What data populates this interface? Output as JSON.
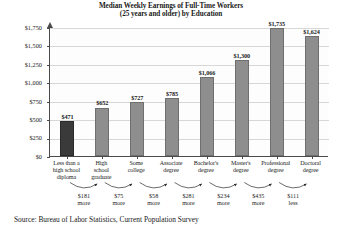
{
  "chart_data": {
    "type": "bar",
    "title": "Median Weekly Earnings of Full-Time Workers (25 years and older) by Education",
    "title_line1": "Median Weekly Earnings of Full-Time Workers",
    "title_line2": "(25 years and older) by Education",
    "xlabel": "",
    "ylabel": "",
    "ylim": [
      0,
      1750
    ],
    "ytick_step": 250,
    "grid": true,
    "legend": "none",
    "categories": [
      "Less than a high school diploma",
      "High school graduate",
      "Some college",
      "Associate degree",
      "Bachelor's degree",
      "Master's degree",
      "Professional degree",
      "Doctoral degree"
    ],
    "category_lines": [
      [
        "Less than a",
        "high school",
        "diploma"
      ],
      [
        "High",
        "school",
        "graduate"
      ],
      [
        "Some",
        "college"
      ],
      [
        "Associate",
        "degree"
      ],
      [
        "Bachelor's",
        "degree"
      ],
      [
        "Master's",
        "degree"
      ],
      [
        "Professional",
        "degree"
      ],
      [
        "Doctoral",
        "degree"
      ]
    ],
    "values": [
      471,
      652,
      727,
      785,
      1066,
      1300,
      1735,
      1624
    ],
    "value_labels": [
      "$471",
      "$652",
      "$727",
      "$785",
      "$1,066",
      "$1,300",
      "$1,735",
      "$1,624"
    ],
    "ytick_labels": [
      "$1,750",
      "$1,500",
      "$1,250",
      "$1,000",
      "$750",
      "$500",
      "$250",
      "$0"
    ],
    "ytick_values": [
      1750,
      1500,
      1250,
      1000,
      750,
      500,
      250,
      0
    ],
    "deltas": [
      {
        "amount": "$181",
        "direction": "more"
      },
      {
        "amount": "$75",
        "direction": "more"
      },
      {
        "amount": "$58",
        "direction": "more"
      },
      {
        "amount": "$281",
        "direction": "more"
      },
      {
        "amount": "$234",
        "direction": "more"
      },
      {
        "amount": "$435",
        "direction": "more"
      },
      {
        "amount": "$111",
        "direction": "less"
      }
    ],
    "bar_colors": [
      "#3a3a3a",
      "#8e8e8e",
      "#8e8e8e",
      "#8e8e8e",
      "#8e8e8e",
      "#8e8e8e",
      "#8e8e8e",
      "#8e8e8e"
    ],
    "source": "Source: Bureau of Labor Statistics, Current Population Survey"
  }
}
